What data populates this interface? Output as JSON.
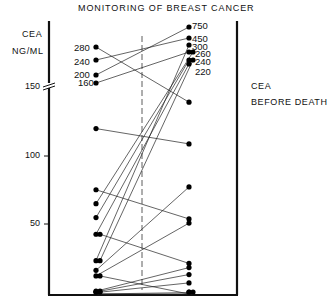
{
  "chart_data": {
    "type": "line",
    "title": "MONITORING OF BREAST CANCER",
    "ylabel": "CEA NG/ML",
    "legend": [
      "CEA",
      "BEFORE DEATH"
    ],
    "xlabel": "",
    "y_ticks": [
      50,
      100,
      150
    ],
    "y_axis_break_at": 150,
    "ylim": [
      0,
      150
    ],
    "grid": false,
    "left_annotations": [
      280,
      240,
      200,
      160
    ],
    "right_annotations": [
      750,
      450,
      300,
      260,
      240,
      220
    ],
    "pairs": [
      {
        "before": 280,
        "death": 138
      },
      {
        "before": 240,
        "death": 450
      },
      {
        "before": 200,
        "death": 750
      },
      {
        "before": 160,
        "death": 260
      },
      {
        "before": 119,
        "death": 108
      },
      {
        "before": 75,
        "death": 54
      },
      {
        "before": 65,
        "death": 260
      },
      {
        "before": 55,
        "death": 240
      },
      {
        "before": 43,
        "death": 220
      },
      {
        "before": 43,
        "death": 22
      },
      {
        "before": 24,
        "death": 300
      },
      {
        "before": 24,
        "death": 240
      },
      {
        "before": 17,
        "death": 77
      },
      {
        "before": 13,
        "death": 51
      },
      {
        "before": 13,
        "death": 0
      },
      {
        "before": 2,
        "death": 19
      },
      {
        "before": 2,
        "death": 14
      },
      {
        "before": 1,
        "death": 8
      },
      {
        "before": 0,
        "death": 1
      },
      {
        "before": 0,
        "death": 0
      }
    ]
  },
  "labels": {
    "title": "MONITORING OF BREAST CANCER",
    "ylabel_line1": "CEA",
    "ylabel_line2": "NG/ML",
    "legend_line1": "CEA",
    "legend_line2": "BEFORE DEATH",
    "tick_150": "150",
    "tick_100": "100",
    "tick_50": "50",
    "left_ann": [
      "280",
      "240",
      "200",
      "160"
    ],
    "right_ann": [
      "750",
      "450",
      "300",
      "260",
      "240",
      "220"
    ]
  }
}
